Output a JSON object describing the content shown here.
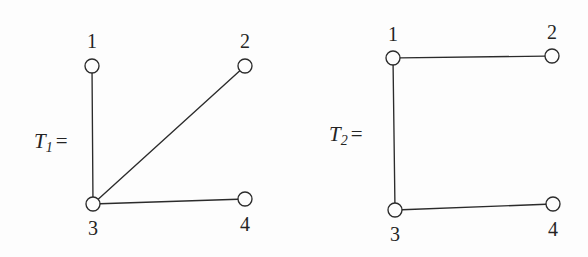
{
  "figure": {
    "background_color": "#fdfdfd",
    "stroke_color": "#2b2b2b",
    "caption": "",
    "width": 588,
    "height": 257
  },
  "chart_data": {
    "type": "diagram",
    "subtype": "graph-node-link",
    "title": "",
    "graphs": [
      {
        "name": "T1",
        "name_symbol": "T",
        "name_subscript": "1",
        "equals_sign": "=",
        "label_x": 34,
        "label_y": 131,
        "nodes": [
          {
            "id": "1",
            "label": "1",
            "x": 92,
            "y": 66,
            "r": 7,
            "label_x": 92,
            "label_y": 31,
            "label_pos": "above"
          },
          {
            "id": "2",
            "label": "2",
            "x": 245,
            "y": 66,
            "r": 7,
            "label_x": 245,
            "label_y": 31,
            "label_pos": "above"
          },
          {
            "id": "3",
            "label": "3",
            "x": 93,
            "y": 204,
            "r": 7,
            "label_x": 93,
            "label_y": 218,
            "label_pos": "below"
          },
          {
            "id": "4",
            "label": "4",
            "x": 245,
            "y": 199,
            "r": 7,
            "label_x": 245,
            "label_y": 214,
            "label_pos": "below"
          }
        ],
        "edges": [
          {
            "from": "1",
            "to": "3"
          },
          {
            "from": "2",
            "to": "3"
          },
          {
            "from": "3",
            "to": "4"
          }
        ]
      },
      {
        "name": "T2",
        "name_symbol": "T",
        "name_subscript": "2",
        "equals_sign": "=",
        "label_x": 329,
        "label_y": 124,
        "nodes": [
          {
            "id": "1",
            "label": "1",
            "x": 393,
            "y": 58,
            "r": 7,
            "label_x": 393,
            "label_y": 24,
            "label_pos": "above"
          },
          {
            "id": "2",
            "label": "2",
            "x": 552,
            "y": 56,
            "r": 7,
            "label_x": 552,
            "label_y": 22,
            "label_pos": "above"
          },
          {
            "id": "3",
            "label": "3",
            "x": 395,
            "y": 210,
            "r": 7,
            "label_x": 395,
            "label_y": 224,
            "label_pos": "below"
          },
          {
            "id": "4",
            "label": "4",
            "x": 553,
            "y": 204,
            "r": 7,
            "label_x": 553,
            "label_y": 219,
            "label_pos": "below"
          }
        ],
        "edges": [
          {
            "from": "1",
            "to": "2"
          },
          {
            "from": "1",
            "to": "3"
          },
          {
            "from": "3",
            "to": "4"
          }
        ]
      }
    ]
  }
}
